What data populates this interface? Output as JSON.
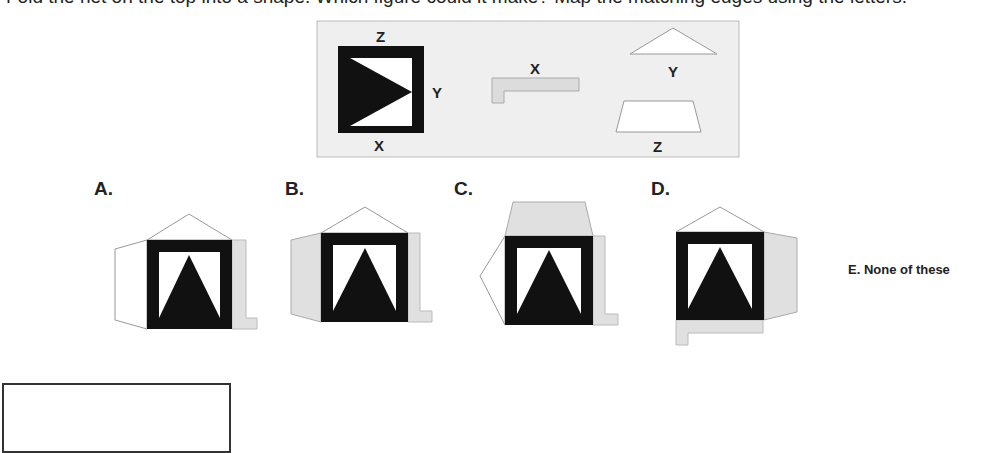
{
  "question": {
    "text": "Fold the net on the top into a shape. Which figure could it make? Map the matching edges using the letters."
  },
  "reference_net": {
    "background_color": "#eeeeee",
    "square_label_top": "Z",
    "square_label_right": "Y",
    "square_label_bottom": "X",
    "piece_x_label": "X",
    "piece_y_label": "Y",
    "piece_z_label": "Z"
  },
  "options": [
    {
      "label": "A."
    },
    {
      "label": "B."
    },
    {
      "label": "C."
    },
    {
      "label": "D."
    },
    {
      "label": "E. None of these"
    }
  ],
  "colors": {
    "dark": "#111111",
    "gray_fill": "#e0e0e0",
    "outline": "#999999",
    "panel": "#efefef"
  },
  "answer_box": {
    "value": ""
  }
}
